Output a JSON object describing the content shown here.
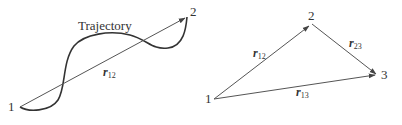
{
  "left_diagram": {
    "trajectory_label": "Trajectory",
    "points": [
      {
        "label": "1",
        "x": 20,
        "y": 107
      },
      {
        "label": "2",
        "x": 187,
        "y": 17
      }
    ],
    "vectors": [
      {
        "symbol": "r",
        "subscript": "12",
        "from": "1",
        "to": "2"
      }
    ]
  },
  "right_diagram": {
    "points": [
      {
        "label": "1",
        "x": 214,
        "y": 99
      },
      {
        "label": "2",
        "x": 311,
        "y": 25
      },
      {
        "label": "3",
        "x": 377,
        "y": 75
      }
    ],
    "vectors": [
      {
        "symbol": "r",
        "subscript": "12",
        "from": "1",
        "to": "2"
      },
      {
        "symbol": "r",
        "subscript": "23",
        "from": "2",
        "to": "3"
      },
      {
        "symbol": "r",
        "subscript": "13",
        "from": "1",
        "to": "3"
      }
    ]
  },
  "colors": {
    "line": "#555555",
    "curve": "#333333",
    "text": "#333333"
  }
}
